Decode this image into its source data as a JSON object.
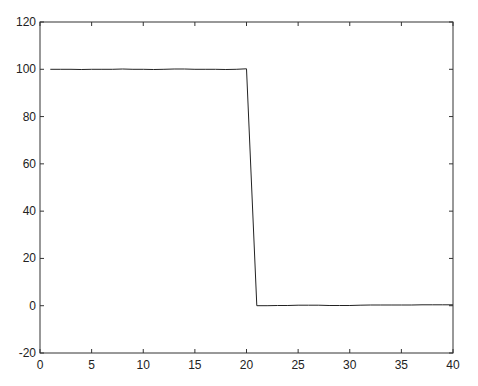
{
  "chart_data": {
    "type": "line",
    "title": "",
    "xlabel": "",
    "ylabel": "",
    "xlim": [
      0,
      40
    ],
    "ylim": [
      -20,
      120
    ],
    "grid": false,
    "legend": null,
    "x_ticks": [
      0,
      5,
      10,
      15,
      20,
      25,
      30,
      35,
      40
    ],
    "y_ticks": [
      -20,
      0,
      20,
      40,
      60,
      80,
      100,
      120
    ],
    "series": [
      {
        "name": "signal",
        "color": "#222222",
        "x": [
          1,
          2,
          3,
          4,
          5,
          6,
          7,
          8,
          9,
          10,
          11,
          12,
          13,
          14,
          15,
          16,
          17,
          18,
          19,
          20,
          21,
          22,
          23,
          24,
          25,
          26,
          27,
          28,
          29,
          30,
          31,
          32,
          33,
          34,
          35,
          36,
          37,
          38,
          39,
          40
        ],
        "values": [
          100,
          100,
          100,
          99.9,
          100,
          100,
          100,
          100.1,
          100,
          100,
          99.9,
          100,
          100.1,
          100.1,
          100,
          100,
          100,
          99.9,
          100,
          100.2,
          0,
          0,
          0.1,
          0.1,
          0.2,
          0.2,
          0.2,
          0.1,
          0.1,
          0.1,
          0.2,
          0.3,
          0.3,
          0.3,
          0.3,
          0.3,
          0.4,
          0.4,
          0.4,
          0.4
        ]
      }
    ]
  }
}
